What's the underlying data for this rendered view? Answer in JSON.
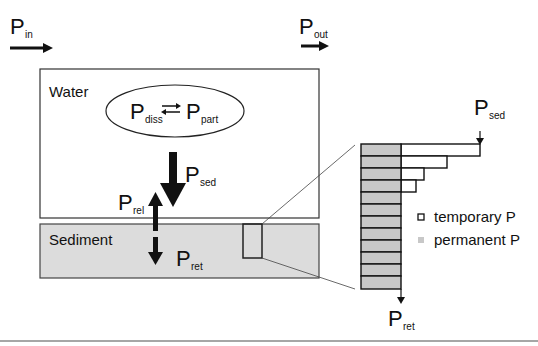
{
  "flows": {
    "p_in": {
      "main": "P",
      "sub": "in"
    },
    "p_out": {
      "main": "P",
      "sub": "out"
    },
    "p_sed": {
      "main": "P",
      "sub": "sed"
    },
    "p_rel": {
      "main": "P",
      "sub": "rel"
    },
    "p_ret": {
      "main": "P",
      "sub": "ret"
    },
    "p_sed_detail": {
      "main": "P",
      "sub": "sed"
    },
    "p_ret_detail": {
      "main": "P",
      "sub": "ret"
    }
  },
  "compartments": {
    "water": "Water",
    "sediment": "Sediment"
  },
  "equilibrium": {
    "left": {
      "main": "P",
      "sub": "diss"
    },
    "right": {
      "main": "P",
      "sub": "part"
    },
    "symbol": "⇄"
  },
  "legend": {
    "temporary": "temporary P",
    "permanent": "permanent P"
  },
  "colors": {
    "sediment_fill": "#dcdcdc",
    "permanent_fill": "#c8c8c8",
    "line": "#111111"
  },
  "layers": {
    "count": 12,
    "temporary_bar_right_edges": [
      480,
      447,
      424,
      416
    ]
  }
}
